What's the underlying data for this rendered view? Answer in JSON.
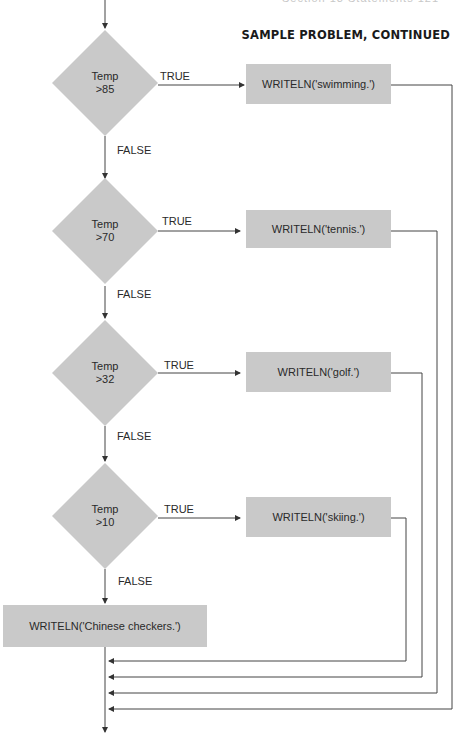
{
  "page": {
    "running_header": "Section 13  Statements   121",
    "section_title": "SAMPLE PROBLEM, CONTINUED"
  },
  "flowchart": {
    "decisions": [
      {
        "line1": "Temp",
        "line2": ">85",
        "true_label": "TRUE",
        "false_label": "FALSE",
        "action": "WRITELN('swimming.')"
      },
      {
        "line1": "Temp",
        "line2": ">70",
        "true_label": "TRUE",
        "false_label": "FALSE",
        "action": "WRITELN('tennis.')"
      },
      {
        "line1": "Temp",
        "line2": ">32",
        "true_label": "TRUE",
        "false_label": "FALSE",
        "action": "WRITELN('golf.')"
      },
      {
        "line1": "Temp",
        "line2": ">10",
        "true_label": "TRUE",
        "false_label": "FALSE",
        "action": "WRITELN('skiing.')"
      }
    ],
    "default_action": "WRITELN('Chinese checkers.')",
    "colors": {
      "shape_fill": "#c9c9c9",
      "line": "#444444"
    }
  }
}
